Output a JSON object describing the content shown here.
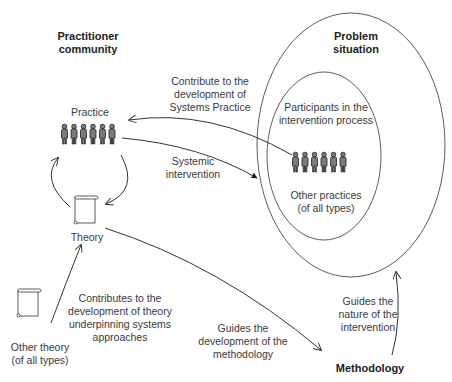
{
  "labels": {
    "practitioner_community": "Practitioner\ncommunity",
    "problem_situation": "Problem\nsituation",
    "practice": "Practice",
    "theory": "Theory",
    "methodology": "Methodology",
    "participants": "Participants in the\nintervention process",
    "other_practices": "Other practices\n(of all types)",
    "other_theory": "Other theory\n(of all types)"
  },
  "arrows": {
    "contribute_practice": "Contribute to the\ndevelopment of\nSystems Practice",
    "systemic_intervention": "Systemic\nintervention",
    "contributes_theory": "Contributes to the\ndevelopment of theory\nunderpinning systems\napproaches",
    "guides_methodology": "Guides the\ndevelopment of the\nmethodology",
    "guides_intervention": "Guides the\nnature of the\nintervention"
  },
  "colors": {
    "stroke": "#333333",
    "figure": "#7a7a7a"
  }
}
